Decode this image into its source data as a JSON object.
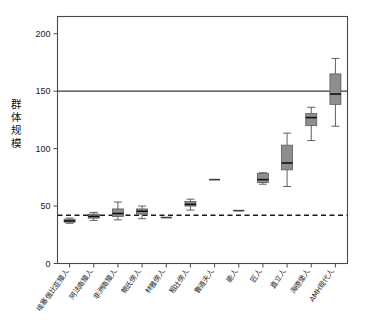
{
  "chart_data": {
    "type": "box",
    "title": "",
    "xlabel": "",
    "ylabel": "群体规模",
    "ylim": [
      0,
      215
    ],
    "yticks": [
      0,
      50,
      100,
      150,
      200
    ],
    "ytick_labels": [
      "0",
      "50",
      "100",
      "150",
      "200"
    ],
    "grid": false,
    "legend": "none",
    "annotations": [
      {
        "name": "solid-reference-line",
        "type": "hline",
        "value": 150,
        "style": "solid"
      },
      {
        "name": "dashed-reference-line",
        "type": "hline",
        "value": 42,
        "style": "dashed"
      }
    ],
    "categories": [
      "埃塞俄比亚猿人",
      "阿法南猿人",
      "非洲南猿人",
      "鲍氏傍人",
      "林雅傍人",
      "粗壮傍人",
      "鲁道夫人",
      "能人",
      "匠人",
      "直立人",
      "海德堡人",
      "AMH现代人"
    ],
    "boxes": [
      {
        "category": "埃塞俄比亚猿人",
        "min": 35.0,
        "q1": 36.0,
        "median": 37.0,
        "q3": 38.5,
        "max": 39.5
      },
      {
        "category": "阿法南猿人",
        "min": 37.5,
        "q1": 39.5,
        "median": 41.0,
        "q3": 43.0,
        "max": 44.5
      },
      {
        "category": "非洲南猿人",
        "min": 38.0,
        "q1": 41.0,
        "median": 43.5,
        "q3": 47.5,
        "max": 53.5
      },
      {
        "category": "鲍氏傍人",
        "min": 39.0,
        "q1": 43.0,
        "median": 45.5,
        "q3": 47.5,
        "max": 50.0
      },
      {
        "category": "林雅傍人",
        "min": 40.0,
        "q1": 40.0,
        "median": 40.0,
        "q3": 40.0,
        "max": 40.0
      },
      {
        "category": "粗壮傍人",
        "min": 46.5,
        "q1": 50.0,
        "median": 51.5,
        "q3": 54.0,
        "max": 56.0
      },
      {
        "category": "鲁道夫人",
        "min": 73.0,
        "q1": 73.0,
        "median": 73.0,
        "q3": 73.0,
        "max": 73.0
      },
      {
        "category": "能人",
        "min": 46.0,
        "q1": 46.0,
        "median": 46.0,
        "q3": 46.0,
        "max": 46.0
      },
      {
        "category": "匠人",
        "min": 69.0,
        "q1": 70.5,
        "median": 73.0,
        "q3": 78.5,
        "max": 79.0
      },
      {
        "category": "直立人",
        "min": 67.0,
        "q1": 81.5,
        "median": 87.5,
        "q3": 103.0,
        "max": 113.5
      },
      {
        "category": "海德堡人",
        "min": 107.0,
        "q1": 120.0,
        "median": 127.0,
        "q3": 130.5,
        "max": 136.0
      },
      {
        "category": "AMH现代人",
        "min": 119.5,
        "q1": 138.5,
        "median": 147.5,
        "q3": 165.0,
        "max": 178.5
      }
    ]
  }
}
